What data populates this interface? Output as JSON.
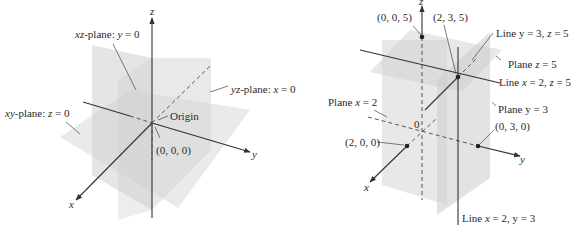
{
  "figure": {
    "left_panel": {
      "axes": {
        "x": "x",
        "y": "y",
        "z": "z"
      },
      "labels": {
        "xz_plane": {
          "prefix": "xz",
          "text": "-plane: ",
          "var": "y",
          "eq": " = 0"
        },
        "yz_plane": {
          "prefix": "yz",
          "text": "-plane: ",
          "var": "x",
          "eq": " = 0"
        },
        "xy_plane": {
          "prefix": "xy",
          "text": "-plane: ",
          "var": "z",
          "eq": " = 0"
        },
        "origin": "Origin",
        "origin_coords": "(0, 0, 0)"
      }
    },
    "right_panel": {
      "axes": {
        "x": "x",
        "y": "y",
        "z": "z"
      },
      "points": {
        "p005": "(0, 0, 5)",
        "p235": "(2, 3, 5)",
        "p200": "(2, 0, 0)",
        "p030": "(0, 3, 0)",
        "origin": "0"
      },
      "labels": {
        "line_y3_z5": {
          "a": "Line y = 3, ",
          "var": "z",
          "b": " = 5"
        },
        "plane_z5": {
          "a": "Plane ",
          "var": "z",
          "b": " = 5"
        },
        "line_x2_z5": {
          "a": "Line ",
          "var1": "x",
          "b": " = 2, ",
          "var2": "z",
          "c": " = 5"
        },
        "plane_y3": "Plane y = 3",
        "plane_x2": {
          "a": "Plane ",
          "var": "x",
          "b": " = 2"
        },
        "line_x2_y3": {
          "a": "Line ",
          "var": "x",
          "b": " = 2, y = 3"
        }
      }
    },
    "colors": {
      "plane_fill": "#d9d9d9",
      "axis": "#333333",
      "background": "#ffffff"
    }
  }
}
